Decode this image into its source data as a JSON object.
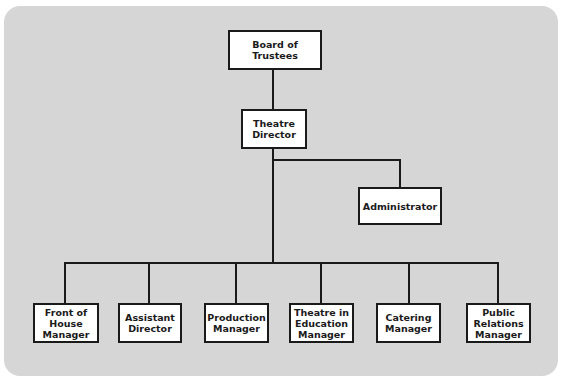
{
  "colors": {
    "panel": "#d6d6d6",
    "line": "#1a1a1a",
    "box": "#ffffff"
  },
  "nodes": {
    "board": "Board of Trustees",
    "director": "Theatre Director",
    "administrator": "Administrator",
    "front_of_house": "Front of House Manager",
    "assistant_director": "Assistant Director",
    "production": "Production Manager",
    "tie": "Theatre in Education Manager",
    "catering": "Catering Manager",
    "public_relations": "Public Relations Manager"
  },
  "hierarchy": {
    "root": "Board of Trustees",
    "children": [
      {
        "name": "Theatre Director",
        "children": [
          {
            "name": "Administrator"
          },
          {
            "name": "Front of House Manager"
          },
          {
            "name": "Assistant Director"
          },
          {
            "name": "Production Manager"
          },
          {
            "name": "Theatre in Education Manager"
          },
          {
            "name": "Catering Manager"
          },
          {
            "name": "Public Relations Manager"
          }
        ]
      }
    ]
  }
}
